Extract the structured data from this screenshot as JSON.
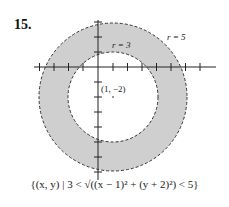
{
  "problem_number": "15.",
  "labels": {
    "inner_radius": "r = 3",
    "outer_radius": "r = 5",
    "center": "(1, −2)"
  },
  "caption": "{(x, y) | 3 < √((x − 1)² + (y + 2)²) < 5}",
  "colors": {
    "shade": "#cfcfcf",
    "stroke": "#333333"
  }
}
